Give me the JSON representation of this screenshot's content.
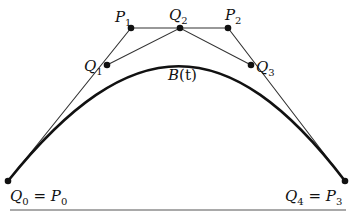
{
  "diagram": {
    "curve_label": {
      "base": "B",
      "arg": "(t)"
    },
    "colors": {
      "ink": "#111111",
      "control_polygon": "#333333",
      "background": "#ffffff"
    },
    "points": [
      {
        "id": "P0",
        "x": 8,
        "y": 181
      },
      {
        "id": "P1",
        "x": 131,
        "y": 28
      },
      {
        "id": "P2",
        "x": 228,
        "y": 28
      },
      {
        "id": "P3",
        "x": 345,
        "y": 181
      },
      {
        "id": "Q1",
        "x": 107,
        "y": 65
      },
      {
        "id": "Q2",
        "x": 180,
        "y": 28
      },
      {
        "id": "Q3",
        "x": 251,
        "y": 65
      }
    ],
    "labels": {
      "p1": {
        "base": "P",
        "sub": "1"
      },
      "p2": {
        "base": "P",
        "sub": "2"
      },
      "q1": {
        "base": "Q",
        "sub": "1"
      },
      "q2": {
        "base": "Q",
        "sub": "2"
      },
      "q3": {
        "base": "Q",
        "sub": "3"
      },
      "start": {
        "left_base": "Q",
        "left_sub": "0",
        "eq": " = ",
        "right_base": "P",
        "right_sub": "0"
      },
      "end": {
        "left_base": "Q",
        "left_sub": "4",
        "eq": " = ",
        "right_base": "P",
        "right_sub": "3"
      }
    }
  }
}
